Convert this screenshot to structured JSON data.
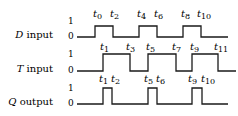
{
  "signals": [
    {
      "name": "D",
      "suffix": "input",
      "level_high": "1",
      "level_low": "0",
      "high_y": 26,
      "low_y": 37,
      "start_x": 77,
      "end_x": 228,
      "transitions": [
        95,
        113,
        139,
        157,
        183,
        201
      ],
      "time_labels": [
        {
          "t": "t",
          "n": "0",
          "x": 93
        },
        {
          "t": "t",
          "n": "2",
          "x": 110
        },
        {
          "t": "t",
          "n": "4",
          "x": 137
        },
        {
          "t": "t",
          "n": "6",
          "x": 154
        },
        {
          "t": "t",
          "n": "8",
          "x": 181
        },
        {
          "t": "t",
          "n": "10",
          "x": 197
        }
      ],
      "labels_y": 17
    },
    {
      "name": "T",
      "suffix": "input",
      "level_high": "1",
      "level_low": "0",
      "high_y": 54,
      "low_y": 71,
      "start_x": 77,
      "end_x": 236,
      "transitions": [
        103,
        130,
        148,
        176,
        192,
        218
      ],
      "time_labels": [
        {
          "t": "t",
          "n": "1",
          "x": 100
        },
        {
          "t": "t",
          "n": "3",
          "x": 126
        },
        {
          "t": "t",
          "n": "5",
          "x": 146
        },
        {
          "t": "t",
          "n": "7",
          "x": 172
        },
        {
          "t": "t",
          "n": "9",
          "x": 190
        },
        {
          "t": "t",
          "n": "11",
          "x": 214
        }
      ],
      "labels_y": 50
    },
    {
      "name": "Q",
      "suffix": "output",
      "level_high": "1",
      "level_low": "0",
      "high_y": 88,
      "low_y": 104,
      "start_x": 77,
      "end_x": 228,
      "transitions": [
        103,
        112,
        148,
        157,
        192,
        202
      ],
      "time_labels": [
        {
          "t": "t",
          "n": "1",
          "x": 99
        },
        {
          "t": "t",
          "n": "2",
          "x": 111
        },
        {
          "t": "t",
          "n": "5",
          "x": 144
        },
        {
          "t": "t",
          "n": "6",
          "x": 156
        },
        {
          "t": "t",
          "n": "9",
          "x": 188
        },
        {
          "t": "t",
          "n": "10",
          "x": 201
        }
      ],
      "labels_y": 82
    }
  ]
}
